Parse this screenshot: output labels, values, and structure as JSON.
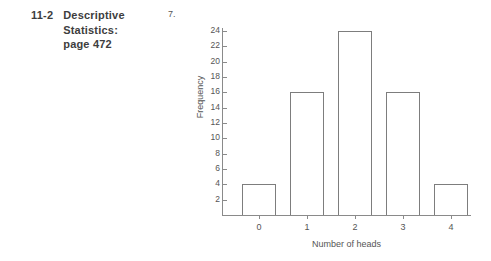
{
  "page": {
    "background_color": "#ffffff",
    "ink_color": "#4a4a4a"
  },
  "header": {
    "section_number": "11-2",
    "title_line_1": "Descriptive",
    "title_line_2": "Statistics:",
    "title_line_3": "page 472"
  },
  "problem": {
    "number": "7."
  },
  "chart_data": {
    "type": "bar",
    "title": "",
    "subtitle": "",
    "xlabel": "Number of heads",
    "ylabel": "Frequency",
    "categories": [
      "0",
      "1",
      "2",
      "3",
      "4"
    ],
    "values": [
      4,
      16,
      24,
      16,
      4
    ],
    "ylim": [
      0,
      24
    ],
    "xlim": [
      -0.75,
      4.75
    ],
    "y_ticks": [
      2,
      4,
      6,
      8,
      10,
      12,
      14,
      16,
      18,
      20,
      22,
      24
    ],
    "y_tick_labels": [
      "2",
      "4",
      "6",
      "8",
      "10",
      "12",
      "14",
      "16",
      "18",
      "20",
      "22",
      "24"
    ],
    "x_ticks": [
      0,
      1,
      2,
      3,
      4
    ],
    "x_tick_labels": [
      "0",
      "1",
      "2",
      "3",
      "4"
    ],
    "grid": false,
    "legend": false,
    "legend_position": "none",
    "bar_style": "outline",
    "bar_edge_color": "#7d7d7d",
    "bar_fill_color": "transparent",
    "axis_color": "#8a8a8a",
    "annotations": []
  }
}
